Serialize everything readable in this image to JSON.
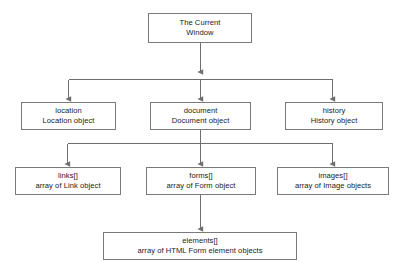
{
  "diagram": {
    "type": "tree-diagram",
    "colors": {
      "background": "#ffffff",
      "box_border": "#7a7a7a",
      "connector": "#6e6e6e",
      "text": "#1a1a1a"
    },
    "nodes": [
      {
        "id": "window",
        "name": "The Current",
        "description": "Window",
        "level": 0,
        "x": 148,
        "y": 13,
        "width": 104,
        "height": 30
      },
      {
        "id": "location",
        "name": "location",
        "description": "Location object",
        "level": 1,
        "x": 21,
        "y": 102,
        "width": 95,
        "height": 28
      },
      {
        "id": "document",
        "name": "document",
        "description": "Document object",
        "level": 1,
        "x": 150,
        "y": 102,
        "width": 101,
        "height": 28
      },
      {
        "id": "history",
        "name": "history",
        "description": "History object",
        "level": 1,
        "x": 285,
        "y": 102,
        "width": 98,
        "height": 28
      },
      {
        "id": "links",
        "name": "links[]",
        "description": "array of Link object",
        "level": 2,
        "x": 15,
        "y": 167,
        "width": 106,
        "height": 28
      },
      {
        "id": "forms",
        "name": "forms[]",
        "description": "array of Form object",
        "level": 2,
        "x": 146,
        "y": 167,
        "width": 110,
        "height": 28
      },
      {
        "id": "images",
        "name": "images[]",
        "description": "array of Image objects",
        "level": 2,
        "x": 277,
        "y": 167,
        "width": 112,
        "height": 28
      },
      {
        "id": "elements",
        "name": "elements[]",
        "description": "array of HTML Form element objects",
        "level": 3,
        "x": 103,
        "y": 232,
        "width": 194,
        "height": 28
      }
    ],
    "edges": [
      {
        "from": "window",
        "to": "location",
        "style": "orthogonal-bus",
        "arrow": true
      },
      {
        "from": "window",
        "to": "document",
        "style": "straight",
        "arrow": true
      },
      {
        "from": "window",
        "to": "history",
        "style": "orthogonal-bus",
        "arrow": true
      },
      {
        "from": "document",
        "to": "links",
        "style": "orthogonal-bus",
        "arrow": true
      },
      {
        "from": "document",
        "to": "forms",
        "style": "straight",
        "arrow": true
      },
      {
        "from": "document",
        "to": "images",
        "style": "orthogonal-bus",
        "arrow": true
      },
      {
        "from": "forms",
        "to": "elements",
        "style": "straight",
        "arrow": true
      }
    ]
  }
}
